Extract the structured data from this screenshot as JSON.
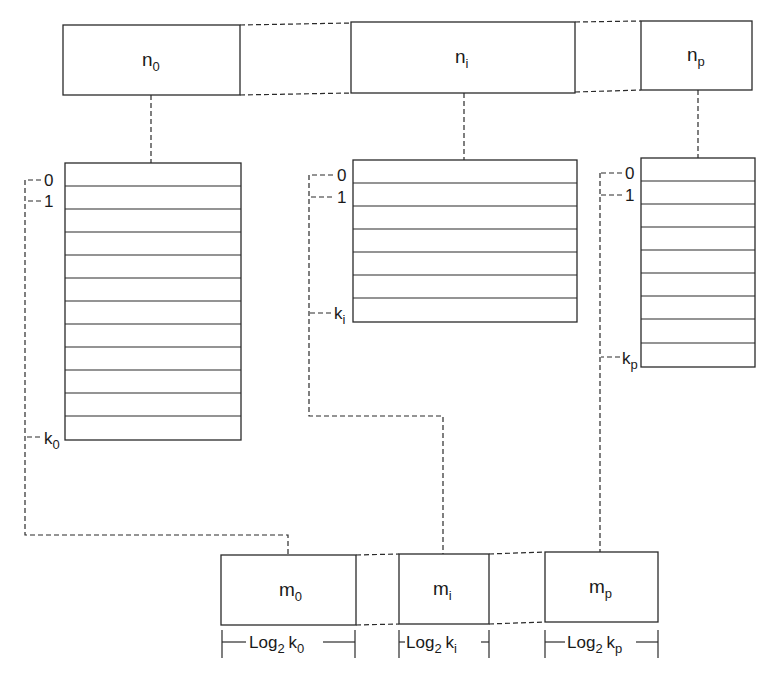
{
  "diagram": {
    "top_nodes": [
      {
        "id": "n0",
        "base": "n",
        "sub": "0"
      },
      {
        "id": "ni",
        "base": "n",
        "sub": "i"
      },
      {
        "id": "np",
        "base": "n",
        "sub": "p"
      }
    ],
    "tables": [
      {
        "id": "table-0",
        "rows": 12,
        "first_label": "0",
        "second_label": "1",
        "last_base": "k",
        "last_sub": "0"
      },
      {
        "id": "table-i",
        "rows": 7,
        "first_label": "0",
        "second_label": "1",
        "last_base": "k",
        "last_sub": "i"
      },
      {
        "id": "table-p",
        "rows": 9,
        "first_label": "0",
        "second_label": "1",
        "last_base": "k",
        "last_sub": "p"
      }
    ],
    "bottom_nodes": [
      {
        "id": "m0",
        "base": "m",
        "sub": "0"
      },
      {
        "id": "mi",
        "base": "m",
        "sub": "i"
      },
      {
        "id": "mp",
        "base": "m",
        "sub": "p"
      }
    ],
    "widths": [
      {
        "prefix": "Log",
        "log_sub": "2",
        "var": "k",
        "var_sub": "0"
      },
      {
        "prefix": "Log",
        "log_sub": "2",
        "var": "k",
        "var_sub": "i"
      },
      {
        "prefix": "Log",
        "log_sub": "2",
        "var": "k",
        "var_sub": "p"
      }
    ],
    "colors": {
      "line": "#2a2a2a",
      "background": "#ffffff",
      "text": "#1a1a1a"
    }
  }
}
